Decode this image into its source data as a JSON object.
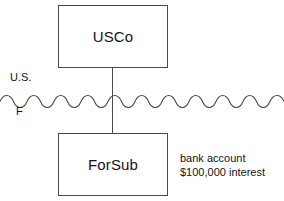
{
  "diagram": {
    "entities": [
      {
        "id": "usco",
        "label": "USCo",
        "jurisdiction": "U.S."
      },
      {
        "id": "forsub",
        "label": "ForSub",
        "jurisdiction": "F"
      }
    ],
    "jurisdiction_labels": {
      "domestic": "U.S.",
      "foreign": "F"
    },
    "border": {
      "icon": "wavy-border-line",
      "style": "wavy",
      "orientation": "horizontal"
    },
    "connector": {
      "icon": "ownership-line",
      "from": "usco",
      "to": "forsub",
      "style": "solid-vertical"
    },
    "annotation": {
      "lines": [
        "bank account",
        "$100,000 interest"
      ]
    },
    "colors": {
      "background": "#ffffff",
      "stroke": "#4a4a4a",
      "text": "#141414"
    }
  }
}
